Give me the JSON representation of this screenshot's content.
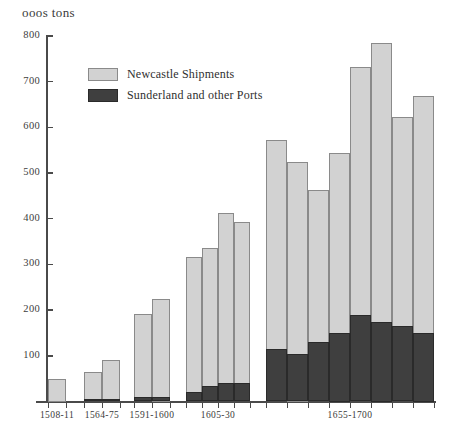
{
  "chart_data": {
    "type": "bar",
    "title": "ooos tons",
    "subtitle": "",
    "xlabel": "",
    "ylabel": "ooos tons",
    "ylim": [
      0,
      800
    ],
    "yticks": [
      100,
      200,
      300,
      400,
      500,
      600,
      700,
      800
    ],
    "ytick_labels": [
      "100",
      "200",
      "300",
      "400",
      "500",
      "600",
      "700",
      "800"
    ],
    "grid": false,
    "legend_position": "upper-left-inside",
    "stacked": true,
    "categories": [
      "1508-11",
      "1564-75",
      "1591-1600",
      "1605-30",
      "1655-1700"
    ],
    "series": [
      {
        "name": "Newcastle Shipments",
        "color": "#d2d2d2"
      },
      {
        "name": "Sunderland and other Ports",
        "color": "#3f3f3f"
      }
    ],
    "groups": [
      {
        "label": "1508-11",
        "bars": [
          {
            "total": 50,
            "dark": 0
          }
        ]
      },
      {
        "label": "1564-75",
        "bars": [
          {
            "total": 65,
            "dark": 5
          },
          {
            "total": 90,
            "dark": 5
          }
        ]
      },
      {
        "label": "1591-1600",
        "bars": [
          {
            "total": 192,
            "dark": 10
          },
          {
            "total": 225,
            "dark": 10
          }
        ]
      },
      {
        "label": "1605-30",
        "bars": [
          {
            "total": 317,
            "dark": 20
          },
          {
            "total": 335,
            "dark": 35
          },
          {
            "total": 413,
            "dark": 40
          },
          {
            "total": 393,
            "dark": 40
          }
        ]
      },
      {
        "label": "1655-1700",
        "bars": [
          {
            "total": 572,
            "dark": 115
          },
          {
            "total": 525,
            "dark": 105
          },
          {
            "total": 462,
            "dark": 130
          },
          {
            "total": 545,
            "dark": 150
          },
          {
            "total": 733,
            "dark": 190
          },
          {
            "total": 785,
            "dark": 175
          },
          {
            "total": 622,
            "dark": 165
          },
          {
            "total": 668,
            "dark": 150
          }
        ]
      }
    ]
  }
}
